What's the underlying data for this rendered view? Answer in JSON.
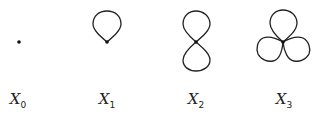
{
  "figure": {
    "items": [
      {
        "symbol": "X",
        "subscript": "0",
        "loops": 0
      },
      {
        "symbol": "X",
        "subscript": "1",
        "loops": 1
      },
      {
        "symbol": "X",
        "subscript": "2",
        "loops": 2
      },
      {
        "symbol": "X",
        "subscript": "3",
        "loops": 3
      }
    ],
    "stroke_color": "#222222",
    "background": "#ffffff"
  }
}
